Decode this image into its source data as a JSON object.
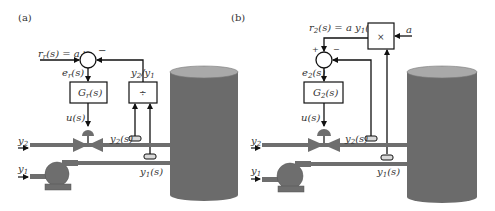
{
  "panels": {
    "a": {
      "tag": "(a)",
      "setpoint_label": "r",
      "setpoint_sub": "r",
      "setpoint_rest": "(s) = a",
      "plus": "+",
      "minus": "−",
      "error_label": "e",
      "error_sub": "r",
      "error_rest": "(s)",
      "controller_label": "G",
      "controller_sub": "r",
      "controller_rest": "(s)",
      "ratio_label": "y",
      "ratio_sub1": "2",
      "ratio_slash": "/y",
      "ratio_sub2": "1",
      "divider_symbol": "÷",
      "u_label": "u(s)",
      "y2_flow": "y",
      "y2_flow_sub": "2",
      "y1_flow": "y",
      "y1_flow_sub": "1",
      "y2_meas": "y",
      "y2_meas_sub": "2",
      "y2_meas_rest": "(s)",
      "y1_meas": "y",
      "y1_meas_sub": "1",
      "y1_meas_rest": "(s)"
    },
    "b": {
      "tag": "(b)",
      "setpoint_label": "r",
      "setpoint_sub": "2",
      "setpoint_rest": "(s) = a y",
      "setpoint_sub2": "1",
      "setpoint_rest2": "(s)",
      "plus": "+",
      "minus": "−",
      "error_label": "e",
      "error_sub": "2",
      "error_rest": "(s)",
      "controller_label": "G",
      "controller_sub": "2",
      "controller_rest": "(s)",
      "multiplier_symbol": "×",
      "gain_label": "a",
      "u_label": "u(s)",
      "y2_flow": "y",
      "y2_flow_sub": "2",
      "y1_flow": "y",
      "y1_flow_sub": "1",
      "y2_meas": "y",
      "y2_meas_sub": "2",
      "y2_meas_rest": "(s)",
      "y1_meas": "y",
      "y1_meas_sub": "1",
      "y1_meas_rest": "(s)"
    }
  },
  "colors": {
    "line": "#111111",
    "equipment": "#6e6e6e",
    "tank_body": "#6b6b6b",
    "tank_top": "#a9a9a9",
    "sensor": "#d9d9d9"
  }
}
